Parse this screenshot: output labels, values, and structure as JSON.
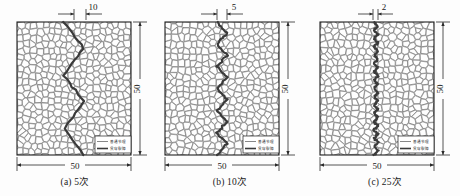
{
  "figure": {
    "type": "technical-diagram",
    "panel_width_px": 150,
    "panel_height_px": 196
  },
  "panels": [
    {
      "id": "a",
      "caption": "(a) 5次",
      "top_dimension": "10",
      "bottom_dimension": "50",
      "right_dimension": "50",
      "legend": {
        "items": [
          {
            "label": "普通节理",
            "style": "thin-line",
            "color": "#555555"
          },
          {
            "label": "贯穿裂隙",
            "style": "thick-line",
            "color": "#3a3a3a"
          }
        ]
      },
      "crack": {
        "amplitude": 10,
        "oscillations": 2.5,
        "thickness": 2.2
      }
    },
    {
      "id": "b",
      "caption": "(b) 10次",
      "top_dimension": "5",
      "bottom_dimension": "50",
      "right_dimension": "50",
      "legend": {
        "items": [
          {
            "label": "普通节理",
            "style": "thin-line",
            "color": "#555555"
          },
          {
            "label": "贯穿裂隙",
            "style": "thick-line",
            "color": "#3a3a3a"
          }
        ]
      },
      "crack": {
        "amplitude": 5,
        "oscillations": 6,
        "thickness": 2.2
      }
    },
    {
      "id": "c",
      "caption": "(c) 25次",
      "top_dimension": "2",
      "bottom_dimension": "50",
      "right_dimension": "50",
      "legend": {
        "items": [
          {
            "label": "普通节理",
            "style": "thin-line",
            "color": "#555555"
          },
          {
            "label": "贯穿裂隙",
            "style": "thick-line",
            "color": "#3a3a3a"
          }
        ]
      },
      "crack": {
        "amplitude": 2,
        "oscillations": 16,
        "thickness": 2.2
      }
    }
  ],
  "colors": {
    "grain_stroke": "#5b5b5b",
    "grain_fill": "#fefefe",
    "crack": "#3a3a3a",
    "dimension": "#2a2a2a",
    "border": "#1f1f1f",
    "text": "#1a1a1a"
  }
}
